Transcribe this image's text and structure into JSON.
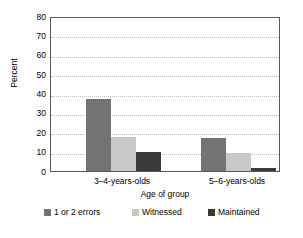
{
  "chart_data": {
    "type": "bar",
    "title": "",
    "subtitle": "",
    "xlabel": "Age of group",
    "ylabel": "Percent",
    "categories": [
      "3–4-years-olds",
      "5–6-years-olds"
    ],
    "series": [
      {
        "name": "1 or 2 errors",
        "values": [
          37,
          17
        ],
        "color": "#737373"
      },
      {
        "name": "Witnessed",
        "values": [
          17.5,
          9.5
        ],
        "color": "#c8c8c8"
      },
      {
        "name": "Maintained",
        "values": [
          10,
          1.5
        ],
        "color": "#3a3a3a"
      }
    ],
    "ylim": [
      0,
      80
    ],
    "ytick_step": 10,
    "yticks": [
      80,
      70,
      60,
      50,
      40,
      30,
      20,
      10,
      0
    ],
    "ytick_labels": [
      "80",
      "70",
      "60",
      "50",
      "40",
      "30",
      "20",
      "10",
      "0"
    ],
    "grid": "horizontal-dotted",
    "grid_color": "#bdbdbd",
    "legend_position": "bottom",
    "frame_color": "#5a5a5a",
    "background": "#ffffff"
  }
}
